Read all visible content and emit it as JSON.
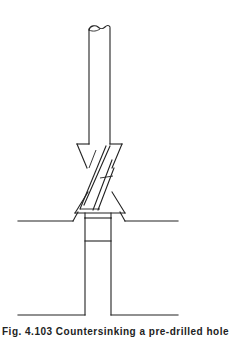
{
  "figure": {
    "components": [
      {
        "name": "drill-shank",
        "label": "Shank"
      },
      {
        "name": "countersink-cutter",
        "label": "Countersink cutter"
      },
      {
        "name": "spiral-flutes",
        "label": "Spiral flutes"
      },
      {
        "name": "workpiece-surface",
        "label": "Workpiece surface"
      },
      {
        "name": "countersunk-recess",
        "label": "Countersunk recess"
      },
      {
        "name": "pilot-hole",
        "label": "Pilot hole"
      },
      {
        "name": "drill-tip",
        "label": "Drill tip"
      }
    ],
    "line_color": "#222222",
    "background": "#ffffff"
  },
  "caption": {
    "text": "Fig. 4.103  Countersinking a pre-drilled hole",
    "visible": "partial"
  }
}
